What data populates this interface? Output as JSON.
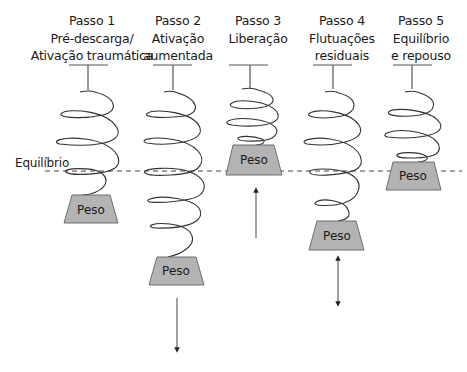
{
  "steps": [
    {
      "label": "Passo 1",
      "lines": [
        "Pré-descarga/",
        "Ativação traumática"
      ]
    },
    {
      "label": "Passo 2",
      "lines": [
        "Ativação",
        "aumentada"
      ]
    },
    {
      "label": "Passo 3",
      "lines": [
        "Liberação",
        ""
      ]
    },
    {
      "label": "Passo 4",
      "lines": [
        "Flutuações",
        "residuais"
      ]
    },
    {
      "label": "Passo 5",
      "lines": [
        "Equilíbrio",
        "e repouso"
      ]
    }
  ],
  "equilibrium_label": "Equilíbrio",
  "weight_label": "Peso",
  "weights": [
    {
      "step": 1,
      "position": "below equilibrium",
      "arrow": "none"
    },
    {
      "step": 2,
      "position": "far below equilibrium",
      "arrow": "down"
    },
    {
      "step": 3,
      "position": "above equilibrium",
      "arrow": "up"
    },
    {
      "step": 4,
      "position": "below equilibrium",
      "arrow": "up-down"
    },
    {
      "step": 5,
      "position": "at equilibrium",
      "arrow": "none"
    }
  ],
  "colors": {
    "weight_fill": "#b3b3b3",
    "weight_stroke": "#6e6e6e",
    "line": "#555555",
    "spring": "#333333",
    "dashed": "#444444"
  }
}
